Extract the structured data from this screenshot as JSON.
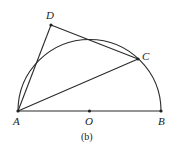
{
  "figure": {
    "caption": "(b)",
    "points": {
      "A": {
        "label": "A",
        "x": 18,
        "y": 111
      },
      "B": {
        "label": "B",
        "x": 161,
        "y": 111
      },
      "O": {
        "label": "O",
        "x": 89.5,
        "y": 111
      },
      "C": {
        "label": "C",
        "x": 138,
        "y": 59
      },
      "D": {
        "label": "D",
        "x": 51,
        "y": 25
      }
    },
    "shapes": {
      "semicircle": "center O, diameter AB",
      "segments": [
        "AB",
        "AC",
        "AD",
        "DC"
      ]
    },
    "colors": {
      "stroke": "#2a2a2a",
      "background": "#ffffff"
    }
  }
}
